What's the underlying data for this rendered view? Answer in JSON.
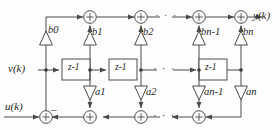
{
  "figure": {
    "type": "signal-flow-block-diagram",
    "line_color": "#4a4a4a",
    "text_color": "#262626",
    "background": "#fefefe"
  },
  "signals": {
    "input_label": "u(k)",
    "state_label": "v(k)",
    "output_label": "y(k)",
    "feedback_sign": "–"
  },
  "delay_blocks": [
    {
      "name": "delay-1",
      "base": "z",
      "exponent": "-1"
    },
    {
      "name": "delay-2",
      "base": "z",
      "exponent": "-1"
    },
    {
      "name": "delay-n",
      "base": "z",
      "exponent": "-1"
    }
  ],
  "feedforward_gains": [
    {
      "name": "gain-b0",
      "symbol": "b",
      "subscript": "0"
    },
    {
      "name": "gain-b1",
      "symbol": "b",
      "subscript": "1"
    },
    {
      "name": "gain-b2",
      "symbol": "b",
      "subscript": "2"
    },
    {
      "name": "gain-bn1",
      "symbol": "b",
      "subscript": "n-1"
    },
    {
      "name": "gain-bn",
      "symbol": "b",
      "subscript": "n"
    }
  ],
  "feedback_gains": [
    {
      "name": "gain-a1",
      "symbol": "a",
      "subscript": "1"
    },
    {
      "name": "gain-a2",
      "symbol": "a",
      "subscript": "2"
    },
    {
      "name": "gain-an1",
      "symbol": "a",
      "subscript": "n-1"
    },
    {
      "name": "gain-an",
      "symbol": "a",
      "subscript": "n"
    }
  ],
  "adders": {
    "top_count": 4,
    "bottom_count": 4,
    "glyph": "+"
  },
  "ellipsis": {
    "top": "· · ·",
    "middle": "· · ·",
    "bottom": "· · ·"
  }
}
